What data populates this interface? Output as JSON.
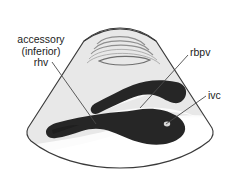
{
  "figure": {
    "modality": "ultrasound-sector-scan",
    "background_color": "#ffffff",
    "fan": {
      "fill_color": "#ebebeb",
      "outline_color": "#3a3a3a",
      "highlight_color": "#ffffff",
      "near_field_band_color": "#9a9a9a"
    },
    "vessel_color": "#262626"
  },
  "labels": {
    "rhv": {
      "line1": "accessory",
      "line2": "(inferior)",
      "line3": "rhv"
    },
    "rbpv": {
      "text": "rbpv"
    },
    "ivc": {
      "text": "ivc"
    }
  },
  "structures": [
    {
      "name": "accessory-inferior-rhv",
      "label": "accessory (inferior) rhv",
      "shade": "dark"
    },
    {
      "name": "rbpv",
      "label": "rbpv",
      "shade": "dark"
    },
    {
      "name": "ivc",
      "label": "ivc",
      "shade": "dark"
    }
  ]
}
